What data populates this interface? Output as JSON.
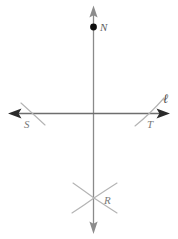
{
  "figure": {
    "background_color": "#ffffff",
    "width": 178,
    "height": 239,
    "colors": {
      "line_stroke": "#6e6e6e",
      "arrow_fill": "#333333",
      "arc_stroke": "#b0b0b0",
      "point_fill": "#111111",
      "label_text": "#7a7a7a",
      "line_label_text": "#4a4a4a"
    },
    "lines": [
      {
        "name": "line-l",
        "label": "ℓ",
        "orientation": "horizontal",
        "x1": 10,
        "y1": 113,
        "x2": 168,
        "y2": 113,
        "arrowheads": "both"
      },
      {
        "name": "vertical-line",
        "label": "",
        "orientation": "vertical",
        "x1": 93,
        "y1": 8,
        "x2": 93,
        "y2": 232,
        "arrowheads": "both"
      }
    ],
    "points": [
      {
        "name": "N",
        "label": "N",
        "x": 93,
        "y": 27,
        "marker": "filled-dot"
      },
      {
        "name": "S",
        "label": "S",
        "x": 30,
        "y": 113,
        "marker": "arc-intersection"
      },
      {
        "name": "T",
        "label": "T",
        "x": 148,
        "y": 113,
        "marker": "arc-intersection"
      },
      {
        "name": "R",
        "label": "R",
        "x": 94,
        "y": 198,
        "marker": "arc-intersection"
      }
    ],
    "arcs": [
      {
        "name": "arc-through-S",
        "through": "S",
        "direction": "upper-left-to-lower-right"
      },
      {
        "name": "arc-through-T",
        "through": "T",
        "direction": "lower-left-to-upper-right"
      },
      {
        "name": "arc-from-S-to-R",
        "through": "R",
        "direction": "upper-left-to-lower-right"
      },
      {
        "name": "arc-from-T-to-R",
        "through": "R",
        "direction": "lower-left-to-upper-right"
      }
    ],
    "labels": {
      "point_n": "N",
      "point_s": "S",
      "point_t": "T",
      "point_r": "R",
      "line_l": "ℓ"
    }
  }
}
